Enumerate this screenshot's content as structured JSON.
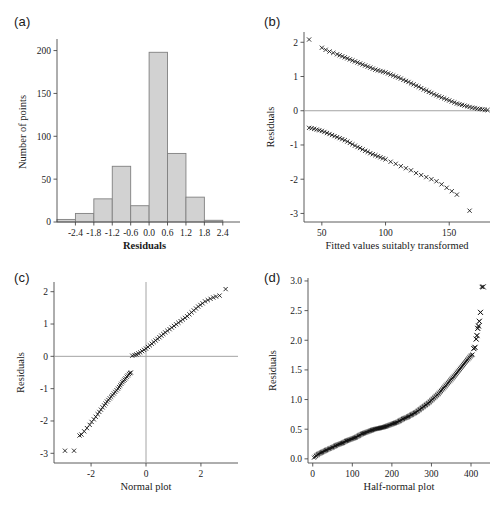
{
  "figure": {
    "cut_off_header": "",
    "panels": [
      "(a)",
      "(b)",
      "(c)",
      "(d)"
    ]
  },
  "panel_a": {
    "tag": "(a)"
  },
  "panel_b": {
    "tag": "(b)"
  },
  "panel_c": {
    "tag": "(c)"
  },
  "panel_d": {
    "tag": "(d)"
  },
  "chart_data": [
    {
      "type": "bar",
      "panel": "(a)",
      "title": "",
      "xlabel": "Residuals",
      "ylabel": "Number of points",
      "xlim": [
        -3.0,
        2.7
      ],
      "ylim": [
        0,
        210
      ],
      "xticks": [
        -2.4,
        -1.8,
        -1.2,
        -0.6,
        0.0,
        0.6,
        1.2,
        1.8,
        2.4
      ],
      "xticklabels": [
        "-2.4",
        "-1.8",
        "-1.2",
        "-0.6",
        "0.0",
        "0.6",
        "1.2",
        "1.8",
        "2.4"
      ],
      "yticks": [
        0,
        50,
        100,
        150,
        200
      ],
      "yticklabels": [
        "0",
        "50",
        "100",
        "150",
        "200"
      ],
      "bin_edges": [
        -3.0,
        -2.4,
        -1.8,
        -1.2,
        -0.6,
        0.0,
        0.6,
        1.2,
        1.8,
        2.4
      ],
      "categories": [
        "-3.0 to -2.4",
        "-2.4 to -1.8",
        "-1.8 to -1.2",
        "-1.2 to -0.6",
        "-0.6 to 0.0",
        "0.0 to 0.6",
        "0.6 to 1.2",
        "1.2 to 1.8",
        "1.8 to 2.4"
      ],
      "values": [
        3,
        10,
        27,
        65,
        19,
        198,
        80,
        29,
        2
      ],
      "grid": false,
      "legend": "none",
      "bar_fill": "#d2d2d2",
      "bar_stroke": "#808080"
    },
    {
      "type": "scatter",
      "panel": "(b)",
      "title": "",
      "xlabel": "Fitted values suitably transformed",
      "ylabel": "Residuals",
      "xlim": [
        36,
        182
      ],
      "ylim": [
        -3.25,
        2.3
      ],
      "xticks": [
        50,
        100,
        150
      ],
      "xticklabels": [
        "50",
        "100",
        "150"
      ],
      "yticks": [
        -3,
        -2,
        -1,
        0,
        1,
        2
      ],
      "yticklabels": [
        "-3",
        "-2",
        "-1",
        "0",
        "1",
        "2"
      ],
      "zero_line_y": 0,
      "marker": "x",
      "grid": false,
      "legend": "none",
      "series": [
        {
          "name": "upper branch",
          "x": [
            40,
            50,
            53,
            56,
            59,
            62,
            64,
            66,
            68,
            70,
            72,
            74,
            76,
            78,
            80,
            82,
            84,
            86,
            88,
            90,
            92,
            94,
            96,
            98,
            100,
            102,
            104,
            106,
            108,
            110,
            112,
            114,
            116,
            118,
            120,
            122,
            124,
            126,
            128,
            130,
            132,
            134,
            136,
            138,
            140,
            142,
            144,
            146,
            148,
            150,
            152,
            154,
            156,
            158,
            160,
            162,
            164,
            166,
            168,
            170,
            172,
            174,
            176,
            178,
            180
          ],
          "y": [
            2.08,
            1.84,
            1.78,
            1.73,
            1.69,
            1.65,
            1.62,
            1.59,
            1.56,
            1.53,
            1.5,
            1.47,
            1.44,
            1.41,
            1.38,
            1.35,
            1.32,
            1.29,
            1.26,
            1.23,
            1.2,
            1.18,
            1.16,
            1.14,
            1.12,
            1.09,
            1.06,
            1.03,
            1.0,
            0.97,
            0.94,
            0.9,
            0.87,
            0.84,
            0.8,
            0.77,
            0.73,
            0.7,
            0.66,
            0.62,
            0.59,
            0.55,
            0.52,
            0.48,
            0.45,
            0.42,
            0.39,
            0.36,
            0.33,
            0.3,
            0.27,
            0.24,
            0.21,
            0.19,
            0.17,
            0.15,
            0.13,
            0.11,
            0.09,
            0.08,
            0.06,
            0.05,
            0.04,
            0.03,
            0.02
          ]
        },
        {
          "name": "lower branch",
          "x": [
            40,
            42,
            44,
            46,
            48,
            50,
            52,
            54,
            56,
            58,
            60,
            62,
            64,
            66,
            68,
            70,
            72,
            74,
            76,
            78,
            80,
            82,
            84,
            86,
            88,
            90,
            92,
            94,
            96,
            98,
            100,
            104,
            108,
            112,
            116,
            120,
            124,
            128,
            132,
            136,
            140,
            144,
            148,
            152,
            156,
            166
          ],
          "y": [
            -0.5,
            -0.51,
            -0.53,
            -0.55,
            -0.57,
            -0.59,
            -0.62,
            -0.65,
            -0.68,
            -0.71,
            -0.74,
            -0.77,
            -0.8,
            -0.83,
            -0.86,
            -0.9,
            -0.94,
            -0.98,
            -1.02,
            -1.06,
            -1.09,
            -1.13,
            -1.17,
            -1.2,
            -1.24,
            -1.27,
            -1.3,
            -1.33,
            -1.36,
            -1.39,
            -1.42,
            -1.49,
            -1.55,
            -1.62,
            -1.68,
            -1.74,
            -1.82,
            -1.88,
            -1.94,
            -2.0,
            -2.06,
            -2.15,
            -2.25,
            -2.35,
            -2.45,
            -2.92
          ]
        }
      ]
    },
    {
      "type": "scatter",
      "panel": "(c)",
      "title": "",
      "xlabel": "Normal plot",
      "ylabel": "Residuals",
      "xlim": [
        -3.35,
        3.35
      ],
      "ylim": [
        -3.3,
        2.3
      ],
      "xticks": [
        -2,
        0,
        2
      ],
      "xticklabels": [
        "-2",
        "0",
        "2"
      ],
      "yticks": [
        -3,
        -2,
        -1,
        0,
        1,
        2
      ],
      "yticklabels": [
        "-3",
        "-2",
        "-1",
        "0",
        "1",
        "2"
      ],
      "zero_line_y": 0,
      "zero_line_x": 0,
      "marker": "x",
      "grid": false,
      "legend": "none",
      "series": [
        {
          "name": "lower branch",
          "x": [
            -2.95,
            -2.62,
            -2.42,
            -2.35,
            -2.25,
            -2.15,
            -2.05,
            -1.98,
            -1.9,
            -1.83,
            -1.76,
            -1.7,
            -1.64,
            -1.58,
            -1.52,
            -1.47,
            -1.42,
            -1.37,
            -1.32,
            -1.27,
            -1.22,
            -1.17,
            -1.12,
            -1.07,
            -1.02,
            -0.98,
            -0.94,
            -0.9,
            -0.86,
            -0.82,
            -0.78,
            -0.74,
            -0.7,
            -0.66,
            -0.62,
            -0.58,
            -0.55
          ],
          "y": [
            -2.92,
            -2.92,
            -2.45,
            -2.42,
            -2.32,
            -2.22,
            -2.12,
            -2.03,
            -1.95,
            -1.87,
            -1.79,
            -1.72,
            -1.65,
            -1.58,
            -1.52,
            -1.46,
            -1.4,
            -1.35,
            -1.3,
            -1.25,
            -1.2,
            -1.15,
            -1.1,
            -1.05,
            -1.0,
            -0.95,
            -0.9,
            -0.85,
            -0.8,
            -0.76,
            -0.72,
            -0.68,
            -0.63,
            -0.59,
            -0.55,
            -0.52,
            -0.5
          ]
        },
        {
          "name": "upper branch",
          "x": [
            -0.5,
            -0.42,
            -0.35,
            -0.28,
            -0.21,
            -0.14,
            -0.07,
            0.0,
            0.07,
            0.14,
            0.21,
            0.28,
            0.35,
            0.42,
            0.49,
            0.56,
            0.63,
            0.7,
            0.78,
            0.86,
            0.94,
            1.02,
            1.1,
            1.18,
            1.26,
            1.34,
            1.42,
            1.5,
            1.58,
            1.66,
            1.74,
            1.82,
            1.9,
            1.98,
            2.06,
            2.15,
            2.25,
            2.35,
            2.45,
            2.55,
            2.68,
            2.9
          ],
          "y": [
            0.02,
            0.04,
            0.06,
            0.09,
            0.12,
            0.16,
            0.2,
            0.24,
            0.29,
            0.34,
            0.39,
            0.44,
            0.49,
            0.54,
            0.59,
            0.64,
            0.69,
            0.74,
            0.79,
            0.84,
            0.89,
            0.94,
            0.99,
            1.04,
            1.09,
            1.14,
            1.19,
            1.24,
            1.3,
            1.36,
            1.42,
            1.48,
            1.54,
            1.59,
            1.64,
            1.7,
            1.74,
            1.78,
            1.82,
            1.85,
            1.88,
            2.08
          ]
        }
      ]
    },
    {
      "type": "scatter",
      "panel": "(d)",
      "title": "",
      "xlabel": "Half-normal plot",
      "ylabel": "Residuals",
      "xlim": [
        -12,
        448
      ],
      "ylim": [
        -0.07,
        3.05
      ],
      "xticks": [
        0,
        100,
        200,
        300,
        400
      ],
      "xticklabels": [
        "0",
        "100",
        "200",
        "300",
        "400"
      ],
      "yticks": [
        0.0,
        0.5,
        1.0,
        1.5,
        2.0,
        2.5,
        3.0
      ],
      "yticklabels": [
        "0.0",
        "0.5",
        "1.0",
        "1.5",
        "2.0",
        "2.5",
        "3.0"
      ],
      "marker": "x",
      "grid": false,
      "legend": "none",
      "series": [
        {
          "name": "ordered absolute residuals",
          "x": [
            3,
            8,
            14,
            20,
            26,
            32,
            38,
            45,
            52,
            60,
            68,
            76,
            84,
            92,
            100,
            108,
            116,
            124,
            132,
            140,
            148,
            156,
            164,
            170,
            176,
            182,
            190,
            198,
            206,
            214,
            222,
            230,
            238,
            246,
            254,
            262,
            270,
            278,
            286,
            294,
            302,
            310,
            318,
            326,
            334,
            342,
            350,
            358,
            364,
            370,
            376,
            382,
            388,
            392,
            396,
            400,
            404,
            407,
            410,
            413,
            415,
            417,
            419,
            421,
            424,
            427,
            431
          ],
          "y": [
            0.02,
            0.05,
            0.08,
            0.1,
            0.12,
            0.14,
            0.16,
            0.18,
            0.2,
            0.23,
            0.25,
            0.27,
            0.3,
            0.32,
            0.34,
            0.36,
            0.39,
            0.42,
            0.44,
            0.46,
            0.48,
            0.5,
            0.51,
            0.52,
            0.53,
            0.54,
            0.56,
            0.58,
            0.6,
            0.62,
            0.65,
            0.68,
            0.7,
            0.73,
            0.76,
            0.79,
            0.83,
            0.87,
            0.91,
            0.95,
            1.0,
            1.05,
            1.1,
            1.16,
            1.22,
            1.28,
            1.34,
            1.4,
            1.45,
            1.5,
            1.55,
            1.6,
            1.65,
            1.68,
            1.71,
            1.74,
            1.76,
            1.86,
            1.88,
            2.02,
            2.08,
            2.2,
            2.24,
            2.32,
            2.47,
            2.9,
            2.9
          ]
        }
      ]
    }
  ]
}
